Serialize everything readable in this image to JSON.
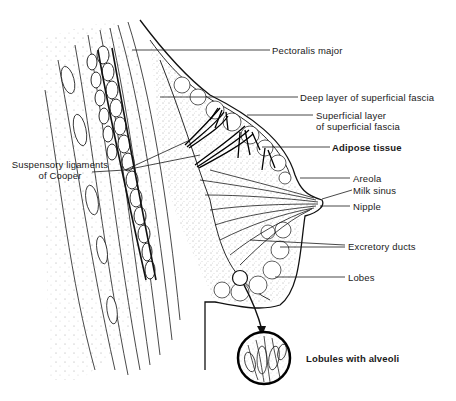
{
  "diagram": {
    "labels": {
      "pectoralis_major": "Pectoralis major",
      "deep_layer": "Deep layer of superficial fascia",
      "superficial_layer_1": "Superficial layer",
      "superficial_layer_2": "of superficial fascia",
      "adipose_tissue": "Adipose tissue",
      "areola": "Areola",
      "milk_sinus": "Milk sinus",
      "nipple": "Nipple",
      "excretory_ducts": "Excretory ducts",
      "lobes": "Lobes",
      "suspensory_1": "Suspensory ligaments",
      "suspensory_2": "of Cooper",
      "lobules": "Lobules with alveoli"
    },
    "colors": {
      "ink": "#1a1a1a",
      "background": "#ffffff"
    }
  }
}
